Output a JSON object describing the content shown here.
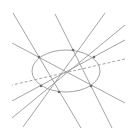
{
  "diagram": {
    "width": 136,
    "height": 139,
    "background": "#ffffff",
    "line_color": "#9a9a9a",
    "point_color": "#6e6e6e",
    "ellipse": {
      "cx": 66,
      "cy": 71,
      "rx": 34,
      "ry": 21,
      "color": "#999999"
    },
    "lines": [
      {
        "id": "line-1",
        "x1": 13,
        "y1": 13,
        "x2": 81,
        "y2": 128,
        "dashed": false
      },
      {
        "id": "line-2",
        "x1": 55,
        "y1": 14,
        "x2": 112,
        "y2": 128,
        "dashed": false
      },
      {
        "id": "line-3",
        "x1": 12,
        "y1": 43,
        "x2": 125,
        "y2": 103,
        "dashed": false
      },
      {
        "id": "line-4",
        "x1": 105,
        "y1": 13,
        "x2": 23,
        "y2": 127,
        "dashed": false
      },
      {
        "id": "line-5",
        "x1": 125,
        "y1": 25,
        "x2": 12,
        "y2": 118,
        "dashed": false
      },
      {
        "id": "line-6",
        "x1": 125,
        "y1": 40,
        "x2": 12,
        "y2": 101,
        "dashed": false
      },
      {
        "id": "line-dashed",
        "x1": 125,
        "y1": 59,
        "x2": 12,
        "y2": 85,
        "dashed": true
      }
    ],
    "points": [
      {
        "id": "p1",
        "x": 39,
        "y": 57
      },
      {
        "id": "p2",
        "x": 73,
        "y": 50
      },
      {
        "id": "p3",
        "x": 94,
        "y": 57
      },
      {
        "id": "p4",
        "x": 41,
        "y": 86
      },
      {
        "id": "p5",
        "x": 59,
        "y": 92
      },
      {
        "id": "p6",
        "x": 91,
        "y": 86
      }
    ]
  }
}
